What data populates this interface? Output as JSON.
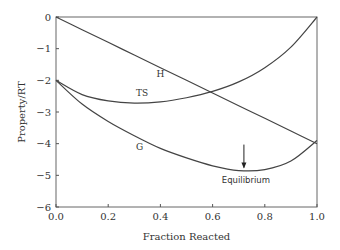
{
  "chart_data": {
    "type": "line",
    "title": "",
    "xlabel": "Fraction Reacted",
    "ylabel": "Property/RT",
    "xlim": [
      0.0,
      1.0
    ],
    "ylim": [
      -6,
      0
    ],
    "xticks": [
      "0.0",
      "0.2",
      "0.4",
      "0.6",
      "0.8",
      "1.0"
    ],
    "yticks": [
      "0",
      "-1",
      "-2",
      "-3",
      "-4",
      "-5",
      "-6"
    ],
    "grid": false,
    "legend": "none (inline curve labels)",
    "x": [
      0.0,
      0.1,
      0.2,
      0.3,
      0.4,
      0.5,
      0.6,
      0.7,
      0.8,
      0.9,
      1.0
    ],
    "series": [
      {
        "name": "H",
        "values": [
          0.0,
          -0.4,
          -0.8,
          -1.2,
          -1.6,
          -2.0,
          -2.4,
          -2.8,
          -3.2,
          -3.6,
          -4.0
        ]
      },
      {
        "name": "TS",
        "values": [
          -2.0,
          -2.45,
          -2.65,
          -2.72,
          -2.68,
          -2.55,
          -2.35,
          -2.05,
          -1.6,
          -0.95,
          0.0
        ]
      },
      {
        "name": "G",
        "values": [
          -2.0,
          -2.75,
          -3.3,
          -3.75,
          -4.15,
          -4.45,
          -4.7,
          -4.85,
          -4.82,
          -4.55,
          -3.9
        ]
      }
    ],
    "annotations": [
      {
        "text": "Equilibrium",
        "x": 0.72,
        "y": -4.85,
        "arrow": true
      }
    ],
    "curve_labels": [
      {
        "text": "H",
        "x": 0.4,
        "y": -1.9
      },
      {
        "text": "TS",
        "x": 0.33,
        "y": -2.5
      },
      {
        "text": "G",
        "x": 0.32,
        "y": -4.2
      }
    ]
  }
}
